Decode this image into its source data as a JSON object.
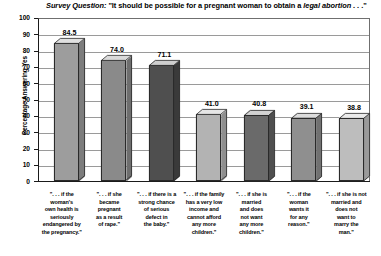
{
  "chart_data": {
    "type": "bar",
    "title": "Survey Question: \"It should be possible for a pregnant woman to obtain a legal abortion . . .\"",
    "title_parts": {
      "label": "Survey Question:",
      "main_before": " \"It should be possible for a pregnant woman to obtain a ",
      "emphasis": "legal abortion",
      "main_after": " . . .\""
    },
    "xlabel": "",
    "ylabel": "Percentage Answering Yes",
    "ylim": [
      0,
      100
    ],
    "ytick_labels": [
      "100",
      "90",
      "80",
      "70",
      "60",
      "50",
      "40",
      "30",
      "20",
      "10",
      "0"
    ],
    "ytick_values": [
      100,
      90,
      80,
      70,
      60,
      50,
      40,
      30,
      20,
      10,
      0
    ],
    "grid": true,
    "legend": "none",
    "categories": [
      "\". . . if the woman's own health is seriously endangered by the pregnancy.\"",
      "\". . . if she became pregnant as a result of rape.\"",
      "\". . . if there is a strong chance of serious defect in the baby.\"",
      "\". . . if the family has a very low income and cannot afford any more children.\"",
      "\". . . if she is married and does not want any more children.\"",
      "\". . . if the woman wants it for any reason.\"",
      "\". . . if she is not married and does not want to marry the man.\""
    ],
    "category_lines": [
      [
        "\". . . if the",
        "woman's",
        "own health is",
        "seriously",
        "endangered by",
        "the pregnancy.\""
      ],
      [
        "\". . . if she",
        "became",
        "pregnant",
        "as a result",
        "of rape.\""
      ],
      [
        "\". . . if there is a",
        "strong chance",
        "of serious",
        "defect in",
        "the baby.\""
      ],
      [
        "\". . . if the family",
        "has a very low",
        "income and",
        "cannot afford",
        "any more",
        "children.\""
      ],
      [
        "\". . . if she is",
        "married",
        "and does",
        "not want",
        "any more",
        "children.\""
      ],
      [
        "\". . . if the",
        "woman",
        "wants it",
        "for any",
        "reason.\""
      ],
      [
        "\". . . if she is not",
        "married and",
        "does not",
        "want to",
        "marry the",
        "man.\""
      ]
    ],
    "values": [
      84.5,
      74.0,
      71.1,
      41.0,
      40.8,
      39.1,
      38.8
    ],
    "value_labels": [
      "84.5",
      "74.0",
      "71.1",
      "41.0",
      "40.8",
      "39.1",
      "38.8"
    ],
    "bar_colors": [
      "#9d9d9d",
      "#8a8a8a",
      "#4f4f4f",
      "#b3b3b3",
      "#6a6a6a",
      "#8f8f8f",
      "#bdbdbd"
    ],
    "bar_side_colors": [
      "#7d7d7d",
      "#6e6e6e",
      "#3a3a3a",
      "#8f8f8f",
      "#4f4f4f",
      "#717171",
      "#9a9a9a"
    ],
    "bar_top_colors": [
      "#e0e0e0",
      "#dadada",
      "#cfcfcf",
      "#e6e6e6",
      "#d2d2d2",
      "#dcdcdc",
      "#ebebeb"
    ],
    "axis_color": "#1a1a1a",
    "gridline_color": "#9a9a9a"
  }
}
